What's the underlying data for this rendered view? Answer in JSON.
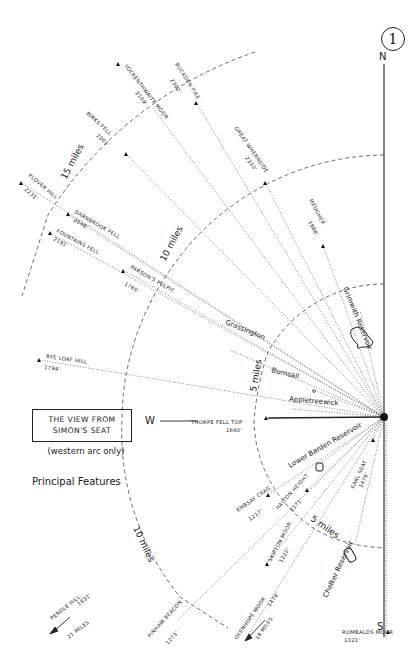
{
  "page_number": "1",
  "title": {
    "line1": "THE VIEW FROM",
    "line2": "SIMON'S SEAT",
    "subtitle": "(western arc only)",
    "legend": "Principal Features"
  },
  "compass": {
    "north": "N",
    "south": "S",
    "west": "W"
  },
  "rings": [
    {
      "label": "5 miles",
      "miles": 5
    },
    {
      "label": "10 miles",
      "miles": 10
    },
    {
      "label": "15 miles",
      "miles": 15
    }
  ],
  "summits": [
    {
      "name": "BUCKDEN PIKE",
      "height": "2302'"
    },
    {
      "name": "YOCKENTHWAITE MOOR",
      "height": "2109'"
    },
    {
      "name": "GREAT WHERNSIDE",
      "height": "2310'"
    },
    {
      "name": "BIRKS FELL",
      "height": "2001'"
    },
    {
      "name": "MEUGHER",
      "height": "1888'"
    },
    {
      "name": "PLOVER HILL",
      "height": "2231'"
    },
    {
      "name": "DARNBROOK FELL",
      "height": "2048'"
    },
    {
      "name": "FOUNTAINS FELL",
      "height": "2191'"
    },
    {
      "name": "PARSON'S PULPIT",
      "height": "1765'"
    },
    {
      "name": "RYE LOAF HILL",
      "height": "1794'"
    },
    {
      "name": "THORPE FELL TOP",
      "height": "1660'"
    },
    {
      "name": "EMBSAY CRAG",
      "height": "1217'"
    },
    {
      "name": "HALTON HEIGHT",
      "height": "1171'"
    },
    {
      "name": "EARL SEAT",
      "height": "1476'"
    },
    {
      "name": "SKIPTON MOOR",
      "height": "1222'"
    },
    {
      "name": "PINHAW BEACON",
      "height": "1273'"
    },
    {
      "name": "OXENHOPE MOOR",
      "height": "1474'",
      "distance": "18 MILES"
    },
    {
      "name": "PENDLE HILL",
      "height": "1831'",
      "distance": "21 MILES"
    },
    {
      "name": "ROMBALDS MOOR",
      "height": "1321'"
    }
  ],
  "places": [
    {
      "name": "Grimwith Reservoir"
    },
    {
      "name": "Grassington"
    },
    {
      "name": "Burnsall"
    },
    {
      "name": "Appletreewick"
    },
    {
      "name": "Lower Barden Reservoir"
    },
    {
      "name": "Chelker Reservoir"
    }
  ]
}
